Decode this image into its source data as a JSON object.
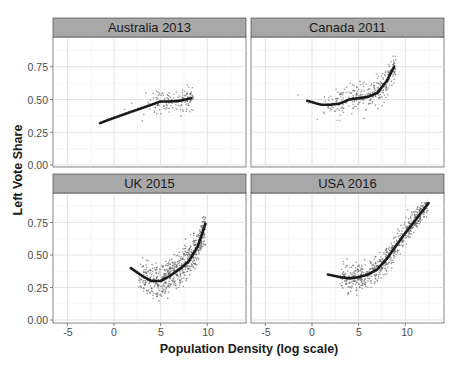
{
  "chart_data": {
    "type": "scatter",
    "title": "",
    "xlabel": "Population Density (log scale)",
    "ylabel": "Left Vote Share",
    "xlim": [
      -6.5,
      13.5
    ],
    "ylim": [
      -0.02,
      0.97
    ],
    "x_ticks": [
      -5,
      0,
      5,
      10
    ],
    "x_tick_labels": [
      "-5",
      "0",
      "5",
      "10"
    ],
    "y_ticks": [
      0,
      0.25,
      0.5,
      0.75
    ],
    "y_tick_labels": [
      "0.00",
      "0.25",
      "0.50",
      "0.75"
    ],
    "grid": true,
    "legend": "none",
    "facets": [
      {
        "label": "Australia 2013",
        "points_approx": {
          "x_range": [
            -2,
            8.5
          ],
          "y_range": [
            0.25,
            0.72
          ],
          "n": 150
        },
        "smooth": {
          "x": [
            -1.5,
            0,
            2,
            4,
            5,
            6,
            7,
            8.3
          ],
          "y": [
            0.32,
            0.36,
            0.41,
            0.46,
            0.485,
            0.485,
            0.49,
            0.51
          ]
        }
      },
      {
        "label": "Canada 2011",
        "points_approx": {
          "x_range": [
            -6,
            9
          ],
          "y_range": [
            0.15,
            0.83
          ],
          "n": 300
        },
        "smooth": {
          "x": [
            -0.5,
            1,
            2,
            3,
            4,
            5,
            6,
            7,
            8,
            8.8
          ],
          "y": [
            0.49,
            0.46,
            0.46,
            0.47,
            0.5,
            0.51,
            0.52,
            0.55,
            0.64,
            0.75
          ]
        }
      },
      {
        "label": "UK 2015",
        "points_approx": {
          "x_range": [
            2,
            10
          ],
          "y_range": [
            0.02,
            0.87
          ],
          "n": 630
        },
        "smooth": {
          "x": [
            1.8,
            3,
            4,
            5,
            6,
            7,
            8,
            9,
            9.8
          ],
          "y": [
            0.4,
            0.34,
            0.3,
            0.3,
            0.34,
            0.39,
            0.45,
            0.57,
            0.74
          ]
        }
      },
      {
        "label": "USA 2016",
        "points_approx": {
          "x_range": [
            3,
            12.5
          ],
          "y_range": [
            0.15,
            0.9
          ],
          "n": 600
        },
        "smooth": {
          "x": [
            1.7,
            3,
            4,
            5,
            6,
            7,
            8,
            9,
            10,
            11,
            12.5
          ],
          "y": [
            0.35,
            0.33,
            0.32,
            0.33,
            0.35,
            0.39,
            0.47,
            0.57,
            0.67,
            0.76,
            0.9
          ]
        }
      }
    ]
  },
  "labels": {
    "xlabel": "Population Density (log scale)",
    "ylabel": "Left Vote Share",
    "facet_1": "Australia 2013",
    "facet_2": "Canada 2011",
    "facet_3": "UK 2015",
    "facet_4": "USA 2016",
    "xt": [
      "-5",
      "0",
      "5",
      "10"
    ],
    "yt": [
      "0.00",
      "0.25",
      "0.50",
      "0.75"
    ]
  },
  "colors": {
    "panel_bg": "#ffffff",
    "grid": "#e0e0e0",
    "strip_bg": "#a8a8a8",
    "points": "#555555",
    "smooth": "#1a1a1a"
  }
}
